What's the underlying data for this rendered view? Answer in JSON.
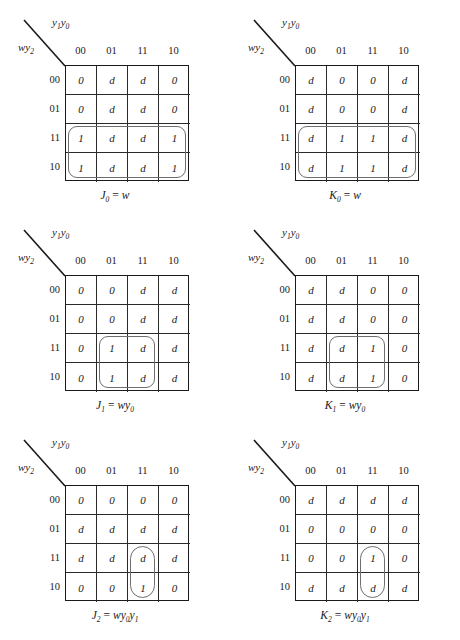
{
  "page": {
    "figure_type": "karnaugh-maps",
    "background_color": "#ffffff",
    "ink_color": "#1a1a1a",
    "loop_color": "#6e6e6e"
  },
  "axis": {
    "column_variables": "y1y0",
    "column_variables_base": "y",
    "column_sub_1": "1",
    "column_var_2": "y",
    "column_sub_2": "0",
    "row_variables": "wy2",
    "row_var_1": "w",
    "row_var_2": "y",
    "row_sub": "2"
  },
  "column_headers": [
    "00",
    "01",
    "11",
    "10"
  ],
  "row_headers": [
    "00",
    "01",
    "11",
    "10"
  ],
  "maps": [
    {
      "id": "j0",
      "caption_var": "J",
      "caption_sub": "0",
      "caption_eq": "=",
      "caption_expr": "w",
      "caption_expr_parts": [
        {
          "t": "w",
          "sub": ""
        }
      ],
      "caption_text": "J0 = w",
      "cells": [
        [
          "0",
          "d",
          "d",
          "0"
        ],
        [
          "0",
          "d",
          "d",
          "0"
        ],
        [
          "1",
          "d",
          "d",
          "1"
        ],
        [
          "1",
          "d",
          "d",
          "1"
        ]
      ],
      "loops": [
        {
          "name": "loop-bottom-rows-all-columns",
          "col": 0,
          "row": 2,
          "colspan": 4,
          "rowspan": 2,
          "radius": 9
        }
      ]
    },
    {
      "id": "k0",
      "caption_var": "K",
      "caption_sub": "0",
      "caption_eq": "=",
      "caption_expr": "w",
      "caption_expr_parts": [
        {
          "t": "w",
          "sub": ""
        }
      ],
      "caption_text": "K0 = w",
      "cells": [
        [
          "d",
          "0",
          "0",
          "d"
        ],
        [
          "d",
          "0",
          "0",
          "d"
        ],
        [
          "d",
          "1",
          "1",
          "d"
        ],
        [
          "d",
          "1",
          "1",
          "d"
        ]
      ],
      "loops": [
        {
          "name": "loop-bottom-rows-all-columns",
          "col": 0,
          "row": 2,
          "colspan": 4,
          "rowspan": 2,
          "radius": 9
        }
      ]
    },
    {
      "id": "j1",
      "caption_var": "J",
      "caption_sub": "1",
      "caption_eq": "=",
      "caption_expr": "wy0",
      "caption_expr_parts": [
        {
          "t": "w",
          "sub": ""
        },
        {
          "t": "y",
          "sub": "0"
        }
      ],
      "caption_text": "J1 = wy0",
      "cells": [
        [
          "0",
          "0",
          "d",
          "d"
        ],
        [
          "0",
          "0",
          "d",
          "d"
        ],
        [
          "0",
          "1",
          "d",
          "d"
        ],
        [
          "0",
          "1",
          "d",
          "d"
        ]
      ],
      "loops": [
        {
          "name": "loop-columns-01-11-bottom-rows",
          "col": 1,
          "row": 2,
          "colspan": 2,
          "rowspan": 2,
          "radius": 9
        }
      ]
    },
    {
      "id": "k1",
      "caption_var": "K",
      "caption_sub": "1",
      "caption_eq": "=",
      "caption_expr": "wy0",
      "caption_expr_parts": [
        {
          "t": "w",
          "sub": ""
        },
        {
          "t": "y",
          "sub": "0"
        }
      ],
      "caption_text": "K1 = wy0",
      "cells": [
        [
          "d",
          "d",
          "0",
          "0"
        ],
        [
          "d",
          "d",
          "0",
          "0"
        ],
        [
          "d",
          "d",
          "1",
          "0"
        ],
        [
          "d",
          "d",
          "1",
          "0"
        ]
      ],
      "loops": [
        {
          "name": "loop-columns-01-11-bottom-rows",
          "col": 1,
          "row": 2,
          "colspan": 2,
          "rowspan": 2,
          "radius": 9
        }
      ]
    },
    {
      "id": "j2",
      "caption_var": "J",
      "caption_sub": "2",
      "caption_eq": "=",
      "caption_expr": "wy0y1",
      "caption_expr_parts": [
        {
          "t": "w",
          "sub": ""
        },
        {
          "t": "y",
          "sub": "0"
        },
        {
          "t": "y",
          "sub": "1"
        }
      ],
      "caption_text": "J2 = wy0y1",
      "cells": [
        [
          "0",
          "0",
          "0",
          "0"
        ],
        [
          "d",
          "d",
          "d",
          "d"
        ],
        [
          "d",
          "d",
          "d",
          "d"
        ],
        [
          "0",
          "0",
          "1",
          "0"
        ]
      ],
      "loops": [
        {
          "name": "loop-column-11-bottom-rows",
          "col": 2,
          "row": 2,
          "colspan": 1,
          "rowspan": 2,
          "radius": 13
        }
      ]
    },
    {
      "id": "k2",
      "caption_var": "K",
      "caption_sub": "2",
      "caption_eq": "=",
      "caption_expr": "wy0y1",
      "caption_expr_parts": [
        {
          "t": "w",
          "sub": ""
        },
        {
          "t": "y",
          "sub": "0"
        },
        {
          "t": "y",
          "sub": "1"
        }
      ],
      "caption_text": "K2 = wy0y1",
      "cells": [
        [
          "d",
          "d",
          "d",
          "d"
        ],
        [
          "0",
          "0",
          "0",
          "0"
        ],
        [
          "0",
          "0",
          "1",
          "0"
        ],
        [
          "d",
          "d",
          "d",
          "d"
        ]
      ],
      "loops": [
        {
          "name": "loop-column-11-bottom-rows",
          "col": 2,
          "row": 2,
          "colspan": 1,
          "rowspan": 2,
          "radius": 13
        }
      ]
    }
  ]
}
